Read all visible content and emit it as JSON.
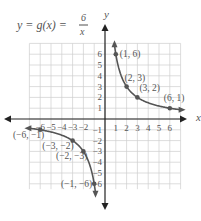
{
  "chart_data": {
    "type": "line",
    "title_parts": {
      "lhs": "y = g(x) = ",
      "num": "6",
      "den": "x"
    },
    "xlabel": "x",
    "ylabel": "y",
    "xlim": [
      -7,
      7
    ],
    "ylim": [
      -7,
      7
    ],
    "grid": true,
    "x_ticks": [
      "-6",
      "-5",
      "-4",
      "-3",
      "-2",
      "1",
      "2",
      "3",
      "4",
      "5",
      "6"
    ],
    "y_ticks": [
      "6",
      "5",
      "4",
      "3",
      "2",
      "1",
      "-1",
      "-2",
      "-3",
      "-4",
      "-5",
      "-6"
    ],
    "series": [
      {
        "name": "g(x)=6/x (x>0)",
        "function": "6/x",
        "domain": [
          0.88,
          7.0
        ]
      },
      {
        "name": "g(x)=6/x (x<0)",
        "function": "6/x",
        "domain": [
          -7.0,
          -0.88
        ]
      }
    ],
    "points": [
      {
        "x": 1,
        "y": 6,
        "label": "(1, 6)"
      },
      {
        "x": 2,
        "y": 3,
        "label": "(2, 3)"
      },
      {
        "x": 3,
        "y": 2,
        "label": "(3, 2)"
      },
      {
        "x": 6,
        "y": 1,
        "label": "(6, 1)"
      },
      {
        "x": -6,
        "y": -1,
        "label": "(−6, −1)"
      },
      {
        "x": -3,
        "y": -2,
        "label": "(−3, −2)"
      },
      {
        "x": -2,
        "y": -3,
        "label": "(−2, −3)"
      },
      {
        "x": -1,
        "y": -6,
        "label": "(−1, −6)"
      }
    ],
    "colors": {
      "curve": "#555555",
      "grid": "#cfcfcf",
      "axis": "#222222",
      "text": "#555555"
    }
  }
}
